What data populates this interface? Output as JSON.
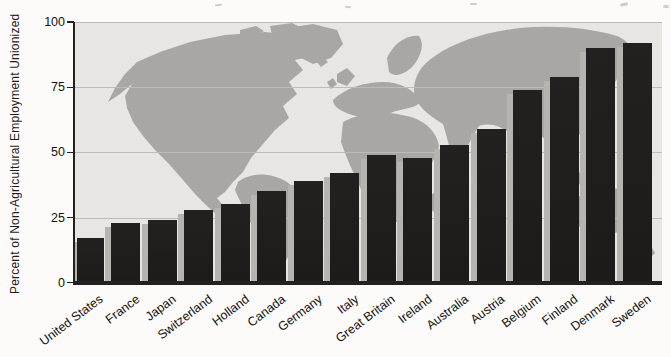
{
  "figure": {
    "type": "scanned-textbook-bar-chart"
  },
  "chart_data": {
    "type": "bar",
    "categories": [
      "United States",
      "France",
      "Japan",
      "Switzerland",
      "Holland",
      "Canada",
      "Germany",
      "Italy",
      "Great Britain",
      "Ireland",
      "Australia",
      "Austria",
      "Belgium",
      "Finland",
      "Denmark",
      "Sweden"
    ],
    "values": [
      17,
      23,
      24,
      28,
      30,
      35,
      39,
      42,
      49,
      48,
      53,
      59,
      74,
      79,
      90,
      92
    ],
    "ylabel": "Percent of Non-Agricultural Employment Unionized",
    "xlabel": "",
    "ylim": [
      0,
      100
    ],
    "yticks": [
      0,
      25,
      50,
      75,
      100
    ],
    "gridlines": [
      25,
      50,
      75,
      100
    ],
    "grid": true,
    "legend": false,
    "background": "world-map-silhouette",
    "colors": {
      "bar": "#232120",
      "bar_shadow": "#b6b4b1",
      "plot_bg": "#e8e6e2",
      "map": "#a9a7a3",
      "gridline": "#bdbbb7",
      "axis": "#232120",
      "text": "#141312"
    }
  }
}
